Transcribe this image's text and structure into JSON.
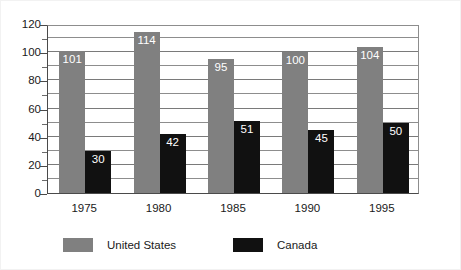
{
  "chart_data": {
    "type": "bar",
    "title": "",
    "subtitle": "",
    "xlabel": "",
    "ylabel": "",
    "categories": [
      "1975",
      "1980",
      "1985",
      "1990",
      "1995"
    ],
    "series": [
      {
        "name": "United States",
        "color": "#808080",
        "values": [
          101,
          114,
          95,
          100,
          104
        ]
      },
      {
        "name": "Canada",
        "color": "#111111",
        "values": [
          30,
          42,
          51,
          45,
          50
        ]
      }
    ],
    "ylim": [
      0,
      120
    ],
    "ytick_labels": [
      "0",
      "20",
      "40",
      "60",
      "80",
      "100",
      "120"
    ],
    "ytick_values": [
      0,
      20,
      40,
      60,
      80,
      100,
      120
    ],
    "minor_tick_values": [
      10,
      30,
      50,
      70,
      90,
      110
    ],
    "gridlines": [
      10,
      20,
      30,
      40,
      50,
      60,
      70,
      80,
      90,
      100,
      110,
      120
    ],
    "grid": true,
    "grid_axis": "y",
    "legend_position": "bottom",
    "data_labels": true,
    "data_label_color": "#ffffff",
    "bar_labels": {
      "1975": {
        "United States": "101",
        "Canada": "30"
      },
      "1980": {
        "United States": "114",
        "Canada": "42"
      },
      "1985": {
        "United States": "95",
        "Canada": "51"
      },
      "1990": {
        "United States": "100",
        "Canada": "45"
      },
      "1995": {
        "United States": "104",
        "Canada": "50"
      }
    }
  },
  "legend": {
    "items": [
      {
        "label": "United States",
        "color": "#808080"
      },
      {
        "label": "Canada",
        "color": "#111111"
      }
    ]
  },
  "axis": {
    "y_labels": [
      "120",
      "100",
      "80",
      "60",
      "40",
      "20",
      "0"
    ],
    "x_labels": [
      "1975",
      "1980",
      "1985",
      "1990",
      "1995"
    ]
  },
  "colors": {
    "united_states": "#808080",
    "canada": "#111111",
    "gridline": "#8d8d8d",
    "axis": "#4a4a4a",
    "background": "#ffffff",
    "text": "#1a1a1a",
    "data_label": "#ffffff"
  }
}
